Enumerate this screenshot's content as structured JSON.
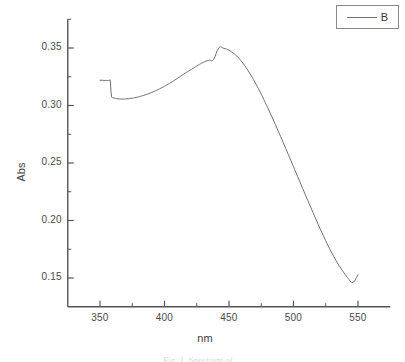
{
  "figure": {
    "background_color": "#ffffff",
    "axis_color": "#555555",
    "curve_color": "#6e6e6e",
    "text_color": "#3d3d3d"
  },
  "legend": {
    "entries": [
      {
        "label": "B",
        "line_color": "#6e6e6e"
      }
    ]
  },
  "caption": {
    "text": "Fig. 1. Spectrum of ..."
  },
  "chart_data": {
    "type": "line",
    "title": "",
    "subtitle": "",
    "xlabel": "nm",
    "ylabel": "Abs",
    "xlim": [
      325,
      575
    ],
    "ylim": [
      0.125,
      0.375
    ],
    "xticks": [
      350,
      400,
      450,
      500,
      550
    ],
    "yticks": [
      0.15,
      0.2,
      0.25,
      0.3,
      0.35
    ],
    "xtick_labels": [
      "350",
      "400",
      "450",
      "500",
      "550"
    ],
    "ytick_labels": [
      "0.15",
      "0.20",
      "0.25",
      "0.30",
      "0.35"
    ],
    "minor_ticks": true,
    "grid": false,
    "legend_position": "top-right",
    "annotations": [],
    "series": [
      {
        "name": "B",
        "color": "#6e6e6e",
        "line_width": 1,
        "x": [
          350,
          352,
          354,
          356,
          357,
          358,
          358.5,
          359,
          360,
          362,
          364,
          366,
          368,
          370,
          374,
          378,
          382,
          386,
          390,
          394,
          398,
          402,
          406,
          410,
          414,
          418,
          422,
          426,
          430,
          434,
          438,
          442,
          446,
          450,
          454,
          458,
          462,
          466,
          470,
          474,
          478,
          482,
          486,
          490,
          494,
          498,
          502,
          506,
          510,
          514,
          518,
          522,
          526,
          530,
          534,
          538,
          542,
          546,
          550
        ],
        "y": [
          0.322,
          0.3219,
          0.3218,
          0.3217,
          0.3216,
          0.3215,
          0.312,
          0.3075,
          0.3068,
          0.3062,
          0.3058,
          0.3056,
          0.3056,
          0.3057,
          0.3062,
          0.307,
          0.3082,
          0.3096,
          0.3113,
          0.3133,
          0.3155,
          0.318,
          0.3207,
          0.3236,
          0.3266,
          0.3295,
          0.3322,
          0.335,
          0.3375,
          0.3392,
          0.34,
          0.35,
          0.3497,
          0.348,
          0.345,
          0.3407,
          0.335,
          0.3282,
          0.3205,
          0.312,
          0.3028,
          0.2932,
          0.2832,
          0.273,
          0.2626,
          0.252,
          0.2414,
          0.2308,
          0.2202,
          0.2098,
          0.1995,
          0.1895,
          0.18,
          0.1712,
          0.1633,
          0.1563,
          0.1503,
          0.1462,
          0.153
        ],
        "peak": {
          "x": 442,
          "y": 0.35
        },
        "start": {
          "x": 350,
          "y": 0.322
        },
        "end": {
          "x": 550,
          "y": 0.153
        },
        "local_min": {
          "x": 367,
          "y": 0.3056
        }
      }
    ]
  }
}
